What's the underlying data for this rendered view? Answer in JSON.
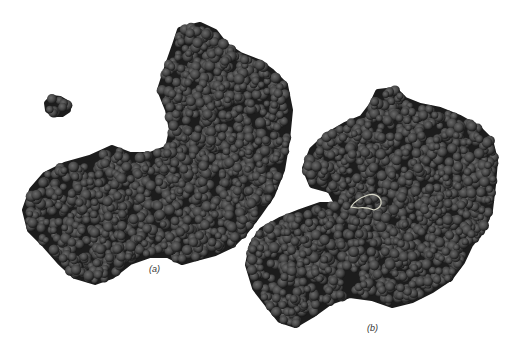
{
  "figure": {
    "panels": [
      {
        "id": "a",
        "label": "(a)",
        "description": "space-filling molecular model, open conformation, with small separate ligand cluster at upper left"
      },
      {
        "id": "b",
        "label": "(b)",
        "description": "space-filling molecular model, closed conformation, with highlighted ligand in cleft"
      }
    ]
  },
  "colors": {
    "background": "#ffffff",
    "atom_fill": "#4a4a4a",
    "atom_shadow": "#1a1a1a",
    "highlight_outline": "#d8d8c8"
  }
}
